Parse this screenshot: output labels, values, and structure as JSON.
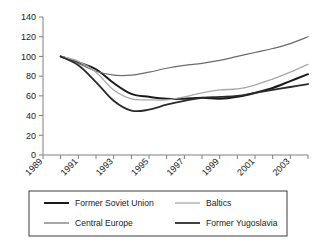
{
  "chart_data": {
    "type": "line",
    "title": "",
    "xlabel": "",
    "ylabel": "",
    "ylim": [
      0,
      140
    ],
    "ytick_values": [
      0,
      20,
      40,
      60,
      80,
      100,
      120,
      140
    ],
    "ytick_labels": [
      "0",
      "20",
      "40",
      "60",
      "80",
      "100",
      "120",
      "140"
    ],
    "grid": false,
    "legend_position": "bottom",
    "x": [
      1989,
      1990,
      1991,
      1992,
      1993,
      1994,
      1995,
      1996,
      1997,
      1998,
      1999,
      2000,
      2001,
      2002,
      2003,
      2004
    ],
    "xtick_labels": [
      "1989",
      "",
      "1991",
      "",
      "1993",
      "",
      "1995",
      "",
      "1997",
      "",
      "1999",
      "",
      "2001",
      "",
      "2003",
      ""
    ],
    "xtick_labels_shown": [
      "1989",
      "1991",
      "1993",
      "1995",
      "1997",
      "1999",
      "2001",
      "2003"
    ],
    "series": [
      {
        "name": "Former Soviet Union",
        "color": "#1a1a1a",
        "width": 2.0,
        "values": [
          null,
          100,
          94,
          87,
          73,
          62,
          59,
          57,
          57,
          58,
          57,
          59,
          63,
          68,
          75,
          82
        ]
      },
      {
        "name": "Central Europe",
        "color": "#6b6b6b",
        "width": 1.2,
        "values": [
          null,
          100,
          93,
          85,
          81,
          81,
          84,
          88,
          91,
          93,
          96,
          100,
          104,
          108,
          113,
          120
        ]
      },
      {
        "name": "Baltics",
        "color": "#a8a8a8",
        "width": 1.3,
        "values": [
          null,
          100,
          95,
          84,
          66,
          57,
          56,
          56,
          59,
          63,
          66,
          67,
          71,
          77,
          84,
          92
        ]
      },
      {
        "name": "Former Yugoslavia",
        "color": "#2b2b2b",
        "width": 1.8,
        "values": [
          null,
          100,
          91,
          74,
          55,
          45,
          46,
          51,
          55,
          58,
          59,
          60,
          63,
          66,
          69,
          72
        ]
      }
    ]
  },
  "legend": {
    "items": [
      {
        "label": "Former Soviet Union"
      },
      {
        "label": "Baltics"
      },
      {
        "label": "Central Europe"
      },
      {
        "label": "Former Yugoslavia"
      }
    ]
  },
  "axis": {
    "axis_color": "#808080"
  }
}
